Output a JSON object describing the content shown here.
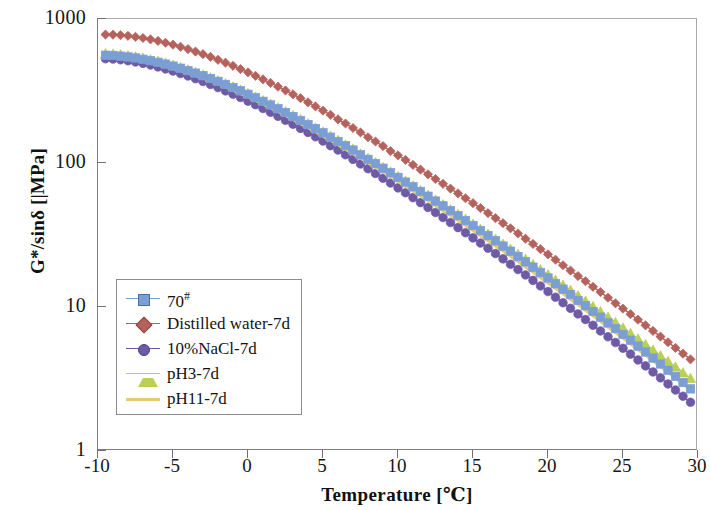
{
  "chart_data": {
    "type": "line",
    "title": "",
    "xlabel": "Temperature [℃]",
    "ylabel": "G*/sinδ [|MPa]",
    "yscale": "log",
    "xlim": [
      -10,
      30
    ],
    "ylim": [
      1,
      1000
    ],
    "xticks": [
      -10,
      -5,
      0,
      5,
      10,
      15,
      20,
      25,
      30
    ],
    "yticks": [
      1,
      10,
      100,
      1000
    ],
    "ytick_labels": [
      "1",
      "10",
      "100",
      "1000"
    ],
    "xtick_labels": [
      "-10",
      "-5",
      "0",
      "5",
      "10",
      "15",
      "20",
      "25",
      "30"
    ],
    "grid": false,
    "legend_position": "lower-left-inside",
    "x": [
      -9.5,
      -9,
      -8.5,
      -8,
      -7.5,
      -7,
      -6.5,
      -6,
      -5.5,
      -5,
      -4.5,
      -4,
      -3.5,
      -3,
      -2.5,
      -2,
      -1.5,
      -1,
      -0.5,
      0,
      0.5,
      1,
      1.5,
      2,
      2.5,
      3,
      3.5,
      4,
      4.5,
      5,
      5.5,
      6,
      6.5,
      7,
      7.5,
      8,
      8.5,
      9,
      9.5,
      10,
      10.5,
      11,
      11.5,
      12,
      12.5,
      13,
      13.5,
      14,
      14.5,
      15,
      15.5,
      16,
      16.5,
      17,
      17.5,
      18,
      18.5,
      19,
      19.5,
      20,
      20.5,
      21,
      21.5,
      22,
      22.5,
      23,
      23.5,
      24,
      24.5,
      25,
      25.5,
      26,
      26.5,
      27,
      27.5,
      28,
      28.5,
      29,
      29.5
    ],
    "series": [
      {
        "name": "70#",
        "color": "#7b9fd4",
        "marker": "square",
        "values": [
          560,
          558,
          552,
          545,
          536,
          525,
          513,
          500,
          486,
          471,
          455,
          438,
          421,
          404,
          386,
          369,
          351,
          334,
          317,
          300,
          284,
          268,
          253,
          238,
          224,
          210,
          197,
          185,
          173,
          162,
          151,
          141,
          132,
          123,
          114,
          106,
          99,
          92,
          85.5,
          79.4,
          73.7,
          68.4,
          63.4,
          58.8,
          54.4,
          50.4,
          46.6,
          43.1,
          39.8,
          36.8,
          33.9,
          31.3,
          28.8,
          26.5,
          24.4,
          22.4,
          20.6,
          18.9,
          17.3,
          15.9,
          14.5,
          13.3,
          12.2,
          11.1,
          10.2,
          9.3,
          8.5,
          7.75,
          7.08,
          6.45,
          5.88,
          5.35,
          4.87,
          4.42,
          4.02,
          3.64,
          3.3,
          2.99,
          2.7
        ]
      },
      {
        "name": "Distilled water-7d",
        "color": "#b5625c",
        "marker": "diamond",
        "values": [
          780,
          778,
          772,
          764,
          752,
          738,
          722,
          704,
          684,
          663,
          641,
          618,
          594,
          570,
          546,
          521,
          497,
          473,
          449,
          426,
          403,
          381,
          360,
          339,
          319,
          300,
          282,
          264,
          247,
          231,
          216,
          201,
          188,
          175,
          163,
          151,
          141,
          131,
          121,
          113,
          105,
          97,
          90,
          83.5,
          77.4,
          71.7,
          66.4,
          61.5,
          56.9,
          52.6,
          48.6,
          44.9,
          41.4,
          38.2,
          35.2,
          32.4,
          29.8,
          27.4,
          25.2,
          23.2,
          21.3,
          19.5,
          17.9,
          16.4,
          15.1,
          13.8,
          12.7,
          11.6,
          10.6,
          9.74,
          8.91,
          8.16,
          7.46,
          6.82,
          6.23,
          5.69,
          5.2,
          4.74,
          4.33
        ]
      },
      {
        "name": "10%NaCl-7d",
        "color": "#6f5aa6",
        "marker": "circle",
        "values": [
          530,
          527,
          521,
          513,
          503,
          492,
          479,
          465,
          450,
          435,
          418,
          402,
          385,
          368,
          351,
          334,
          317,
          301,
          285,
          269,
          254,
          239,
          225,
          211,
          198,
          186,
          174,
          163,
          152,
          142,
          132,
          123,
          114,
          106,
          98.5,
          91.3,
          84.6,
          78.4,
          72.6,
          67.2,
          62.1,
          57.5,
          53.1,
          49.1,
          45.3,
          41.8,
          38.6,
          35.6,
          32.8,
          30.2,
          27.8,
          25.6,
          23.5,
          21.6,
          19.8,
          18.2,
          16.7,
          15.3,
          14.0,
          12.8,
          11.7,
          10.7,
          9.79,
          8.95,
          8.18,
          7.47,
          6.82,
          6.22,
          5.67,
          5.17,
          4.71,
          4.29,
          3.9,
          3.54,
          3.22,
          2.92,
          2.65,
          2.4,
          2.18
        ]
      },
      {
        "name": "pH3-7d",
        "color": "#b9cf55",
        "marker": "triangle",
        "values": [
          575,
          572,
          566,
          558,
          548,
          537,
          524,
          510,
          495,
          479,
          462,
          445,
          427,
          410,
          392,
          374,
          356,
          339,
          322,
          305,
          288,
          272,
          257,
          242,
          228,
          214,
          201,
          188,
          176,
          165,
          154,
          144,
          134,
          125,
          116,
          108,
          101,
          93.6,
          87.0,
          80.8,
          75.0,
          69.6,
          64.6,
          59.9,
          55.5,
          51.4,
          47.6,
          44.1,
          40.8,
          37.7,
          34.8,
          32.2,
          29.7,
          27.4,
          25.3,
          23.3,
          21.5,
          19.8,
          18.2,
          16.8,
          15.4,
          14.2,
          13.1,
          12.0,
          11.0,
          10.1,
          9.3,
          8.53,
          7.82,
          7.17,
          6.57,
          6.01,
          5.5,
          5.03,
          4.6,
          4.2,
          3.84,
          3.5,
          3.2
        ]
      },
      {
        "name": "pH11-7d",
        "color": "#e8c87a",
        "marker": "none",
        "values": [
          545,
          543,
          537,
          530,
          521,
          510,
          498,
          485,
          470,
          455,
          439,
          423,
          406,
          389,
          372,
          355,
          338,
          321,
          304,
          288,
          272,
          257,
          242,
          228,
          214,
          201,
          188,
          176,
          165,
          154,
          144,
          134,
          125,
          116,
          108,
          100.5,
          93.4,
          86.7,
          80.4,
          74.5,
          69.0,
          63.9,
          59.1,
          54.7,
          50.6,
          46.7,
          43.2,
          39.9,
          36.8,
          34.0,
          31.3,
          28.9,
          26.6,
          24.5,
          22.5,
          20.7,
          19.0,
          17.5,
          16.0,
          14.7,
          13.5,
          12.4,
          11.3,
          10.4,
          9.5,
          8.7,
          7.96,
          7.28,
          6.66,
          6.09,
          5.56,
          5.08,
          4.64,
          4.23,
          3.86,
          3.52,
          3.21,
          2.92,
          2.66
        ]
      }
    ]
  },
  "legend": {
    "items": [
      {
        "label": "70",
        "sup": "#",
        "marker": "square",
        "color": "#7b9fd4"
      },
      {
        "label": "Distilled water-7d",
        "sup": "",
        "marker": "diamond",
        "color": "#b5625c"
      },
      {
        "label": "10%NaCl-7d",
        "sup": "",
        "marker": "circle",
        "color": "#6f5aa6"
      },
      {
        "label": "pH3-7d",
        "sup": "",
        "marker": "triangle",
        "color": "#b9cf55"
      },
      {
        "label": "pH11-7d",
        "sup": "",
        "marker": "none",
        "color": "#e8c87a"
      }
    ]
  },
  "axes": {
    "y_title": "G*/sinδ [|MPa]",
    "x_title": "Temperature [℃]"
  },
  "colors": {
    "frame": "#7d7d82",
    "background": "#ffffff",
    "text": "#161616"
  }
}
